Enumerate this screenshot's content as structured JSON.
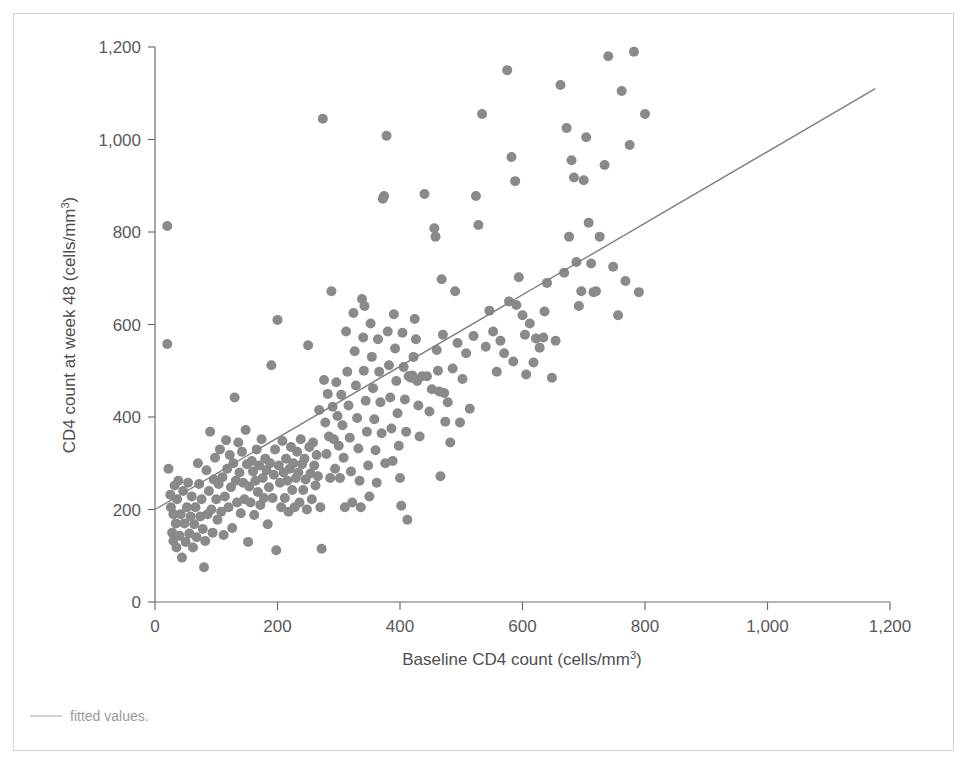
{
  "figure": {
    "background_color": "#ffffff",
    "frame_color": "#d2d2d2",
    "point_color": "#8a8a8a",
    "line_color": "#808080",
    "axis_color": "#6e6e6e",
    "text_color": "#595959"
  },
  "legend": {
    "marker": "line",
    "label": "fitted values."
  },
  "chart_data": {
    "type": "scatter",
    "title": "",
    "xlabel": "Baseline CD4 count (cells/mm³)",
    "xlabel_main": "Baseline CD4 count (cells/mm",
    "xlabel_sup": "3",
    "xlabel_tail": ")",
    "ylabel": "CD4 count at week 48 (cells/mm³)",
    "ylabel_main": "CD4 count at week 48 (cells/mm",
    "ylabel_sup": "3",
    "ylabel_tail": ")",
    "xlim": [
      0,
      1200
    ],
    "ylim": [
      0,
      1200
    ],
    "xticks": [
      0,
      200,
      400,
      600,
      800,
      1000,
      1200
    ],
    "yticks": [
      0,
      200,
      400,
      600,
      800,
      1000,
      1200
    ],
    "xticklabels": [
      "0",
      "200",
      "400",
      "600",
      "800",
      "1,000",
      "1,200"
    ],
    "yticklabels": [
      "0",
      "200",
      "400",
      "600",
      "800",
      "1,000",
      "1,200"
    ],
    "grid": false,
    "legend_position": "below-axes",
    "marker_size_px": 10,
    "fit_line": {
      "name": "fitted values",
      "x": [
        0,
        1176
      ],
      "y": [
        200,
        1110
      ],
      "slope": 0.774,
      "intercept": 200
    },
    "series": [
      {
        "name": "patients",
        "n": 288,
        "points": [
          [
            20,
            813
          ],
          [
            20,
            558
          ],
          [
            22,
            288
          ],
          [
            25,
            232
          ],
          [
            26,
            205
          ],
          [
            28,
            150
          ],
          [
            30,
            190
          ],
          [
            30,
            132
          ],
          [
            32,
            252
          ],
          [
            34,
            170
          ],
          [
            35,
            118
          ],
          [
            36,
            222
          ],
          [
            38,
            262
          ],
          [
            40,
            143
          ],
          [
            42,
            190
          ],
          [
            44,
            96
          ],
          [
            46,
            240
          ],
          [
            48,
            170
          ],
          [
            50,
            130
          ],
          [
            52,
            205
          ],
          [
            54,
            258
          ],
          [
            56,
            148
          ],
          [
            58,
            185
          ],
          [
            60,
            228
          ],
          [
            62,
            118
          ],
          [
            64,
            168
          ],
          [
            66,
            205
          ],
          [
            68,
            140
          ],
          [
            70,
            300
          ],
          [
            72,
            255
          ],
          [
            74,
            185
          ],
          [
            76,
            222
          ],
          [
            78,
            158
          ],
          [
            80,
            75
          ],
          [
            82,
            132
          ],
          [
            84,
            285
          ],
          [
            86,
            190
          ],
          [
            88,
            240
          ],
          [
            90,
            368
          ],
          [
            92,
            200
          ],
          [
            94,
            150
          ],
          [
            96,
            265
          ],
          [
            98,
            312
          ],
          [
            100,
            222
          ],
          [
            102,
            178
          ],
          [
            104,
            255
          ],
          [
            106,
            330
          ],
          [
            108,
            195
          ],
          [
            110,
            270
          ],
          [
            112,
            145
          ],
          [
            114,
            228
          ],
          [
            116,
            350
          ],
          [
            118,
            288
          ],
          [
            120,
            205
          ],
          [
            122,
            318
          ],
          [
            124,
            248
          ],
          [
            126,
            160
          ],
          [
            128,
            300
          ],
          [
            130,
            442
          ],
          [
            132,
            262
          ],
          [
            134,
            215
          ],
          [
            136,
            345
          ],
          [
            138,
            280
          ],
          [
            140,
            192
          ],
          [
            142,
            325
          ],
          [
            144,
            258
          ],
          [
            146,
            222
          ],
          [
            148,
            372
          ],
          [
            150,
            298
          ],
          [
            152,
            130
          ],
          [
            154,
            250
          ],
          [
            156,
            215
          ],
          [
            158,
            305
          ],
          [
            160,
            282
          ],
          [
            162,
            188
          ],
          [
            164,
            262
          ],
          [
            166,
            330
          ],
          [
            168,
            238
          ],
          [
            170,
            295
          ],
          [
            172,
            210
          ],
          [
            174,
            352
          ],
          [
            176,
            268
          ],
          [
            178,
            225
          ],
          [
            180,
            310
          ],
          [
            182,
            285
          ],
          [
            184,
            168
          ],
          [
            186,
            248
          ],
          [
            188,
            300
          ],
          [
            190,
            512
          ],
          [
            192,
            225
          ],
          [
            194,
            275
          ],
          [
            196,
            330
          ],
          [
            198,
            112
          ],
          [
            200,
            610
          ],
          [
            202,
            295
          ],
          [
            204,
            258
          ],
          [
            206,
            205
          ],
          [
            208,
            348
          ],
          [
            210,
            280
          ],
          [
            212,
            225
          ],
          [
            214,
            310
          ],
          [
            216,
            262
          ],
          [
            218,
            195
          ],
          [
            220,
            288
          ],
          [
            222,
            335
          ],
          [
            224,
            242
          ],
          [
            226,
            300
          ],
          [
            228,
            205
          ],
          [
            230,
            268
          ],
          [
            232,
            325
          ],
          [
            234,
            280
          ],
          [
            236,
            215
          ],
          [
            238,
            352
          ],
          [
            240,
            298
          ],
          [
            242,
            242
          ],
          [
            244,
            310
          ],
          [
            246,
            265
          ],
          [
            248,
            200
          ],
          [
            250,
            555
          ],
          [
            252,
            335
          ],
          [
            254,
            278
          ],
          [
            256,
            222
          ],
          [
            258,
            345
          ],
          [
            260,
            295
          ],
          [
            262,
            252
          ],
          [
            264,
            318
          ],
          [
            266,
            272
          ],
          [
            268,
            415
          ],
          [
            270,
            205
          ],
          [
            272,
            115
          ],
          [
            274,
            1045
          ],
          [
            276,
            480
          ],
          [
            278,
            388
          ],
          [
            280,
            320
          ],
          [
            282,
            450
          ],
          [
            284,
            358
          ],
          [
            286,
            268
          ],
          [
            288,
            672
          ],
          [
            290,
            422
          ],
          [
            292,
            352
          ],
          [
            294,
            288
          ],
          [
            296,
            475
          ],
          [
            298,
            402
          ],
          [
            300,
            338
          ],
          [
            302,
            268
          ],
          [
            304,
            448
          ],
          [
            306,
            382
          ],
          [
            308,
            312
          ],
          [
            310,
            205
          ],
          [
            312,
            585
          ],
          [
            314,
            498
          ],
          [
            316,
            425
          ],
          [
            318,
            355
          ],
          [
            320,
            282
          ],
          [
            322,
            215
          ],
          [
            324,
            625
          ],
          [
            326,
            542
          ],
          [
            328,
            468
          ],
          [
            330,
            398
          ],
          [
            332,
            332
          ],
          [
            334,
            262
          ],
          [
            336,
            205
          ],
          [
            338,
            655
          ],
          [
            340,
            572
          ],
          [
            341,
            500
          ],
          [
            342,
            640
          ],
          [
            344,
            435
          ],
          [
            346,
            368
          ],
          [
            348,
            295
          ],
          [
            350,
            228
          ],
          [
            352,
            602
          ],
          [
            354,
            530
          ],
          [
            356,
            462
          ],
          [
            358,
            395
          ],
          [
            360,
            328
          ],
          [
            362,
            258
          ],
          [
            364,
            568
          ],
          [
            366,
            498
          ],
          [
            368,
            432
          ],
          [
            370,
            365
          ],
          [
            372,
            872
          ],
          [
            374,
            878
          ],
          [
            376,
            300
          ],
          [
            378,
            1008
          ],
          [
            380,
            585
          ],
          [
            382,
            512
          ],
          [
            384,
            442
          ],
          [
            386,
            375
          ],
          [
            388,
            305
          ],
          [
            390,
            622
          ],
          [
            392,
            548
          ],
          [
            394,
            478
          ],
          [
            396,
            408
          ],
          [
            398,
            338
          ],
          [
            400,
            268
          ],
          [
            402,
            208
          ],
          [
            404,
            582
          ],
          [
            406,
            508
          ],
          [
            408,
            438
          ],
          [
            410,
            368
          ],
          [
            412,
            178
          ],
          [
            414,
            488
          ],
          [
            416,
            488
          ],
          [
            418,
            485
          ],
          [
            420,
            490
          ],
          [
            422,
            530
          ],
          [
            424,
            612
          ],
          [
            426,
            568
          ],
          [
            428,
            478
          ],
          [
            430,
            425
          ],
          [
            432,
            358
          ],
          [
            436,
            488
          ],
          [
            440,
            882
          ],
          [
            444,
            488
          ],
          [
            448,
            412
          ],
          [
            452,
            460
          ],
          [
            456,
            808
          ],
          [
            458,
            790
          ],
          [
            460,
            545
          ],
          [
            462,
            500
          ],
          [
            464,
            455
          ],
          [
            466,
            272
          ],
          [
            468,
            698
          ],
          [
            470,
            578
          ],
          [
            472,
            452
          ],
          [
            474,
            390
          ],
          [
            478,
            432
          ],
          [
            482,
            345
          ],
          [
            486,
            505
          ],
          [
            490,
            672
          ],
          [
            494,
            560
          ],
          [
            498,
            388
          ],
          [
            502,
            482
          ],
          [
            508,
            538
          ],
          [
            514,
            418
          ],
          [
            520,
            575
          ],
          [
            524,
            878
          ],
          [
            528,
            815
          ],
          [
            534,
            1055
          ],
          [
            540,
            552
          ],
          [
            546,
            630
          ],
          [
            552,
            585
          ],
          [
            558,
            498
          ],
          [
            564,
            565
          ],
          [
            570,
            538
          ],
          [
            575,
            1150
          ],
          [
            578,
            650
          ],
          [
            582,
            962
          ],
          [
            585,
            520
          ],
          [
            588,
            910
          ],
          [
            590,
            642
          ],
          [
            594,
            702
          ],
          [
            600,
            620
          ],
          [
            604,
            578
          ],
          [
            606,
            492
          ],
          [
            612,
            602
          ],
          [
            618,
            518
          ],
          [
            622,
            570
          ],
          [
            628,
            550
          ],
          [
            634,
            572
          ],
          [
            636,
            628
          ],
          [
            640,
            690
          ],
          [
            648,
            485
          ],
          [
            654,
            565
          ],
          [
            662,
            1118
          ],
          [
            668,
            712
          ],
          [
            672,
            1025
          ],
          [
            676,
            790
          ],
          [
            680,
            955
          ],
          [
            684,
            918
          ],
          [
            688,
            735
          ],
          [
            692,
            640
          ],
          [
            696,
            672
          ],
          [
            700,
            912
          ],
          [
            704,
            1005
          ],
          [
            708,
            820
          ],
          [
            712,
            732
          ],
          [
            716,
            670
          ],
          [
            720,
            672
          ],
          [
            726,
            790
          ],
          [
            734,
            945
          ],
          [
            740,
            1180
          ],
          [
            748,
            725
          ],
          [
            756,
            620
          ],
          [
            762,
            1105
          ],
          [
            768,
            694
          ],
          [
            775,
            988
          ],
          [
            782,
            1190
          ],
          [
            790,
            670
          ],
          [
            800,
            1055
          ]
        ]
      }
    ]
  }
}
